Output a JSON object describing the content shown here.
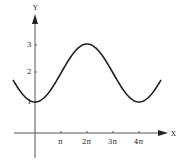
{
  "chart_data": {
    "type": "line",
    "title": "",
    "xlabel": "X",
    "ylabel": "Y",
    "x_ticks": [
      "π",
      "2π",
      "3π",
      "4π"
    ],
    "y_ticks": [
      "1",
      "2",
      "3"
    ],
    "function": "y = 2 - cos(x/2)",
    "x": [
      "-0.85π",
      "0",
      "π",
      "2π",
      "3π",
      "4π",
      "4.85π"
    ],
    "values": [
      2.2,
      1,
      2,
      3,
      2,
      1,
      2.2
    ],
    "xlim": [
      "-0.85π",
      "4.85π"
    ],
    "ylim": [
      0,
      3.8
    ],
    "grid": false,
    "legend": null
  }
}
